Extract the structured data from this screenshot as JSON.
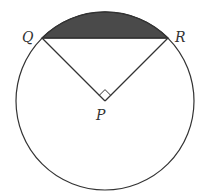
{
  "diagram": {
    "type": "circle-segment",
    "circle": {
      "cx": 105,
      "cy": 101,
      "r": 89
    },
    "points": {
      "Q": {
        "label": "Q",
        "x": 42,
        "y": 38
      },
      "R": {
        "label": "R",
        "x": 168,
        "y": 38
      },
      "P": {
        "label": "P",
        "x": 105,
        "y": 101
      }
    },
    "angle_QPR": "90°",
    "right_angle_marker": true,
    "shaded_region": "minor segment between chord QR and arc QR",
    "colors": {
      "stroke": "#333333",
      "shade": "#4a4a4a",
      "background": "#ffffff"
    }
  }
}
